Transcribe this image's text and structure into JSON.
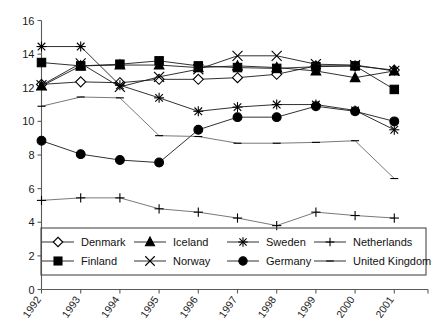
{
  "chart_data": {
    "type": "line",
    "title": "",
    "xlabel": "",
    "ylabel": "",
    "x": [
      1992,
      1993,
      1994,
      1995,
      1996,
      1997,
      1998,
      1999,
      2000,
      2001
    ],
    "xtick_labels": [
      "1992",
      "1993",
      "1994",
      "1995",
      "1996",
      "1997",
      "1998",
      "1999",
      "2000",
      "2001"
    ],
    "ytick_labels": [
      "0",
      "2",
      "4",
      "6",
      "8",
      "10",
      "12",
      "14",
      "16"
    ],
    "yticks": [
      0,
      2,
      4,
      6,
      8,
      10,
      12,
      14,
      16
    ],
    "ylim": [
      0,
      16
    ],
    "xlim": [
      1992,
      2001.8
    ],
    "grid": false,
    "legend_position": "bottom",
    "series": [
      {
        "name": "Denmark",
        "marker": "open-diamond",
        "values": [
          12.2,
          12.35,
          12.3,
          12.5,
          12.5,
          12.6,
          12.8,
          13.3,
          13.3,
          13.05
        ]
      },
      {
        "name": "Finland",
        "marker": "solid-square",
        "values": [
          13.5,
          13.3,
          13.4,
          13.6,
          13.3,
          13.2,
          13.15,
          13.25,
          13.3,
          11.9
        ]
      },
      {
        "name": "Iceland",
        "marker": "solid-triangle",
        "values": [
          12.1,
          13.3,
          13.35,
          13.35,
          13.2,
          13.3,
          13.2,
          13.0,
          12.6,
          13.0
        ]
      },
      {
        "name": "Norway",
        "marker": "x-cross",
        "values": [
          12.15,
          13.45,
          12.05,
          12.65,
          13.1,
          13.9,
          13.9,
          13.4,
          13.35,
          13.0
        ]
      },
      {
        "name": "Sweden",
        "marker": "asterisk",
        "values": [
          14.45,
          14.45,
          12.15,
          11.4,
          10.6,
          10.85,
          11.0,
          11.0,
          10.65,
          9.5
        ]
      },
      {
        "name": "Germany",
        "marker": "solid-circle",
        "values": [
          8.85,
          8.05,
          7.7,
          7.55,
          9.5,
          10.25,
          10.25,
          10.9,
          10.6,
          10.0
        ]
      },
      {
        "name": "Netherlands",
        "marker": "plus",
        "values": [
          5.3,
          5.45,
          5.45,
          4.8,
          4.6,
          4.25,
          3.8,
          4.6,
          4.4,
          4.25
        ]
      },
      {
        "name": "United Kingdom",
        "marker": "dash",
        "values": [
          10.9,
          11.45,
          11.4,
          9.15,
          9.1,
          8.7,
          8.7,
          8.75,
          8.85,
          6.6
        ]
      }
    ]
  },
  "legend": {
    "entries": [
      {
        "label": "Denmark",
        "marker": "open-diamond"
      },
      {
        "label": "Iceland",
        "marker": "solid-triangle"
      },
      {
        "label": "Sweden",
        "marker": "asterisk"
      },
      {
        "label": "Netherlands",
        "marker": "plus"
      },
      {
        "label": "Finland",
        "marker": "solid-square"
      },
      {
        "label": "Norway",
        "marker": "x-cross"
      },
      {
        "label": "Germany",
        "marker": "solid-circle"
      },
      {
        "label": "United Kingdom",
        "marker": "dash"
      }
    ]
  },
  "colors": {
    "line": "#1a1a1a",
    "axis": "#5a5a5a",
    "background": "#ffffff"
  }
}
